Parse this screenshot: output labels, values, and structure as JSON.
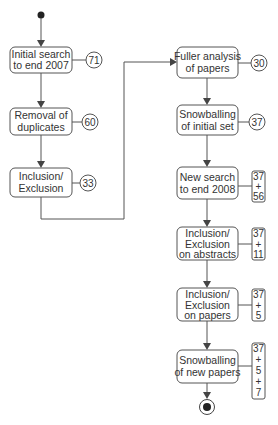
{
  "diagram": {
    "type": "flowchart",
    "start_node": {
      "label": "start"
    },
    "end_node": {
      "label": "end"
    },
    "steps": [
      {
        "id": "s1",
        "lines": [
          "Initial search",
          "to end 2007"
        ],
        "count_lines": [
          "71"
        ],
        "count_shape": "circle"
      },
      {
        "id": "s2",
        "lines": [
          "Removal of",
          "duplicates"
        ],
        "count_lines": [
          "60"
        ],
        "count_shape": "circle"
      },
      {
        "id": "s3",
        "lines": [
          "Inclusion/",
          "Exclusion"
        ],
        "count_lines": [
          "33"
        ],
        "count_shape": "circle"
      },
      {
        "id": "s4",
        "lines": [
          "Fuller analysis",
          "of papers"
        ],
        "count_lines": [
          "30"
        ],
        "count_shape": "circle"
      },
      {
        "id": "s5",
        "lines": [
          "Snowballing",
          "of initial set"
        ],
        "count_lines": [
          "37"
        ],
        "count_shape": "circle"
      },
      {
        "id": "s6",
        "lines": [
          "New search",
          "to end 2008"
        ],
        "count_lines": [
          "37",
          "+",
          "56"
        ],
        "count_shape": "rect"
      },
      {
        "id": "s7",
        "lines": [
          "Inclusion/",
          "Exclusion",
          "on abstracts"
        ],
        "count_lines": [
          "37",
          "+",
          "11"
        ],
        "count_shape": "rect"
      },
      {
        "id": "s8",
        "lines": [
          "Inclusion/",
          "Exclusion",
          "on papers"
        ],
        "count_lines": [
          "37",
          "+",
          "5"
        ],
        "count_shape": "rect"
      },
      {
        "id": "s9",
        "lines": [
          "Snowballing",
          "of new papers"
        ],
        "count_lines": [
          "37",
          "+",
          "5",
          "+",
          "7"
        ],
        "count_shape": "rect"
      }
    ],
    "edges": [
      [
        "start",
        "s1"
      ],
      [
        "s1",
        "s2"
      ],
      [
        "s2",
        "s3"
      ],
      [
        "s3",
        "s4"
      ],
      [
        "s4",
        "s5"
      ],
      [
        "s5",
        "s6"
      ],
      [
        "s6",
        "s7"
      ],
      [
        "s7",
        "s8"
      ],
      [
        "s8",
        "s9"
      ],
      [
        "s9",
        "end"
      ]
    ]
  }
}
